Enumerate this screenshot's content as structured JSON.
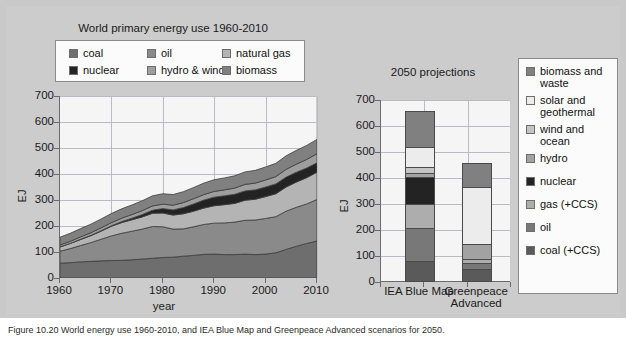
{
  "figure": {
    "background": "#cccccc"
  },
  "caption": {
    "text": "Figure 10.20 World energy use 1960-2010, and IEA Blue Map and Greenpeace Advanced scenarios for 2050."
  },
  "left_chart": {
    "title": "World primary energy use 1960-2010",
    "ylabel": "EJ",
    "xlabel": "year",
    "yticks": [
      "0",
      "100",
      "200",
      "300",
      "400",
      "500",
      "600",
      "700"
    ],
    "xticks": [
      "1960",
      "1970",
      "1980",
      "1990",
      "2000",
      "2010"
    ],
    "legend": [
      {
        "label": "coal",
        "color": "#6e6e6e"
      },
      {
        "label": "oil",
        "color": "#8a8a8a"
      },
      {
        "label": "natural gas",
        "color": "#b4b4b4"
      },
      {
        "label": "nuclear",
        "color": "#232323"
      },
      {
        "label": "hydro & wind",
        "color": "#9e9e9e"
      },
      {
        "label": "biomass",
        "color": "#808080"
      }
    ]
  },
  "right_chart": {
    "title": "2050 projections",
    "ylabel": "EJ",
    "yticks": [
      "0",
      "100",
      "200",
      "300",
      "400",
      "500",
      "600",
      "700"
    ],
    "xticks": [
      "IEA Blue Map",
      "Greenpeace\nAdvanced"
    ],
    "legend": [
      {
        "label": "biomass and\nwaste",
        "color": "#808080"
      },
      {
        "label": "solar and\ngeothermal",
        "color": "#ececec"
      },
      {
        "label": "wind and\nocean",
        "color": "#c4c4c4"
      },
      {
        "label": "hydro",
        "color": "#a2a2a2"
      },
      {
        "label": "nuclear",
        "color": "#232323"
      },
      {
        "label": "gas (+CCS)",
        "color": "#adadad"
      },
      {
        "label": "oil",
        "color": "#787878"
      },
      {
        "label": "coal (+CCS)",
        "color": "#5a5a5a"
      }
    ]
  },
  "chart_data": [
    {
      "type": "area",
      "id": "world-primary-energy-use",
      "title": "World primary energy use 1960-2010",
      "xlabel": "year",
      "ylabel": "EJ",
      "xlim": [
        1960,
        2010
      ],
      "ylim": [
        0,
        700
      ],
      "grid": true,
      "legend_position": "above-plot",
      "stacked": true,
      "x": [
        1960,
        1962,
        1964,
        1966,
        1968,
        1970,
        1972,
        1974,
        1976,
        1978,
        1980,
        1982,
        1984,
        1986,
        1988,
        1990,
        1992,
        1994,
        1996,
        1998,
        2000,
        2002,
        2004,
        2006,
        2008,
        2010
      ],
      "series": [
        {
          "name": "coal",
          "color": "#6e6e6e",
          "values": [
            57,
            59,
            62,
            64,
            66,
            67,
            68,
            70,
            73,
            76,
            79,
            80,
            84,
            87,
            91,
            92,
            90,
            90,
            92,
            90,
            92,
            97,
            110,
            122,
            133,
            142
          ]
        },
        {
          "name": "oil",
          "color": "#8a8a8a",
          "values": [
            46,
            54,
            63,
            72,
            83,
            95,
            104,
            110,
            115,
            122,
            118,
            108,
            105,
            110,
            115,
            119,
            122,
            125,
            130,
            133,
            137,
            139,
            147,
            150,
            152,
            160
          ]
        },
        {
          "name": "natural gas",
          "color": "#b4b4b4",
          "values": [
            17,
            20,
            23,
            27,
            31,
            37,
            41,
            44,
            47,
            51,
            53,
            54,
            58,
            60,
            63,
            67,
            70,
            72,
            77,
            80,
            84,
            88,
            93,
            97,
            101,
            105
          ]
        },
        {
          "name": "nuclear",
          "color": "#232323",
          "values": [
            0,
            0,
            1,
            1,
            2,
            2,
            4,
            6,
            9,
            12,
            17,
            20,
            24,
            28,
            31,
            33,
            34,
            35,
            36,
            36,
            37,
            38,
            38,
            38,
            37,
            36
          ]
        },
        {
          "name": "hydro & wind",
          "color": "#9e9e9e",
          "values": [
            7,
            8,
            9,
            10,
            11,
            12,
            13,
            14,
            15,
            16,
            17,
            18,
            19,
            20,
            21,
            22,
            23,
            24,
            25,
            26,
            27,
            28,
            30,
            31,
            33,
            35
          ]
        },
        {
          "name": "biomass",
          "color": "#808080",
          "values": [
            30,
            31,
            32,
            33,
            34,
            35,
            36,
            37,
            38,
            39,
            40,
            41,
            42,
            43,
            44,
            45,
            46,
            47,
            48,
            49,
            50,
            51,
            52,
            53,
            54,
            55
          ]
        }
      ]
    },
    {
      "type": "bar",
      "id": "2050-projections",
      "title": "2050 projections",
      "ylabel": "EJ",
      "ylim": [
        0,
        700
      ],
      "grid": true,
      "stacked": true,
      "legend_position": "right",
      "categories": [
        "IEA Blue Map",
        "Greenpeace Advanced"
      ],
      "series": [
        {
          "name": "coal (+CCS)",
          "color": "#5a5a5a",
          "values": [
            80,
            50
          ]
        },
        {
          "name": "oil",
          "color": "#787878",
          "values": [
            127,
            22
          ]
        },
        {
          "name": "gas (+CCS)",
          "color": "#adadad",
          "values": [
            93,
            18
          ]
        },
        {
          "name": "nuclear",
          "color": "#232323",
          "values": [
            103,
            0
          ]
        },
        {
          "name": "hydro",
          "color": "#a2a2a2",
          "values": [
            17,
            55
          ]
        },
        {
          "name": "wind and ocean",
          "color": "#c4c4c4",
          "values": [
            23,
            0
          ]
        },
        {
          "name": "solar and geothermal",
          "color": "#ececec",
          "values": [
            77,
            220
          ]
        },
        {
          "name": "biomass and waste",
          "color": "#808080",
          "values": [
            138,
            91
          ]
        }
      ],
      "totals": [
        658,
        456
      ]
    }
  ]
}
